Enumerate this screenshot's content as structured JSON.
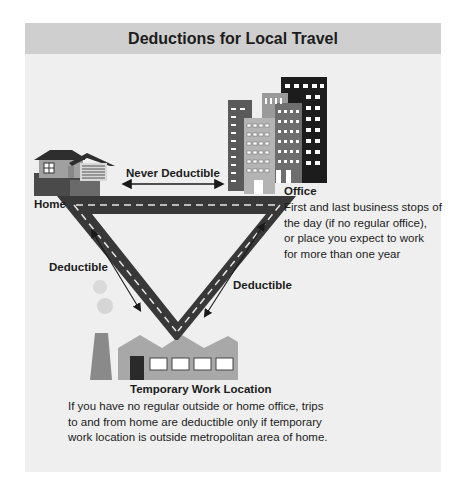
{
  "title": "Deductions for Local Travel",
  "labels": {
    "home": "Home",
    "office": "Office",
    "temporary_work_location": "Temporary Work Location",
    "never_deductible": "Never Deductible",
    "deductible_left": "Deductible",
    "deductible_right": "Deductible"
  },
  "descriptions": {
    "office": [
      "First and last business stops of",
      "the day (if no regular office),",
      "or place you expect to work",
      "for more than one year"
    ],
    "temporary_work_location": [
      "If you have no regular outside or home office, trips",
      "to and from home are deductible only if temporary",
      "work location is outside metropolitan area of home."
    ]
  },
  "icons": [
    "house-icon",
    "office-buildings-icon",
    "factory-icon",
    "road-triangle",
    "double-arrow-icon"
  ],
  "colors": {
    "header_bg": "#cfcfcf",
    "panel_bg": "#efefef",
    "road": "#3a3a3a",
    "lane_marking": "#e6e6e6"
  }
}
